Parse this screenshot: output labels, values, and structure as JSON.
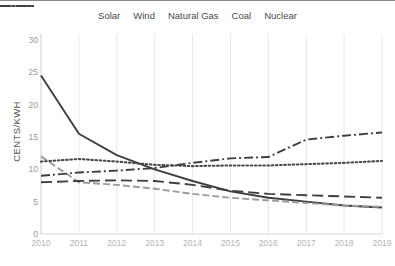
{
  "chart": {
    "type": "line",
    "title": "",
    "xlabel": "",
    "ylabel": "CENTS/KWH"
  },
  "legend": {
    "position": "top",
    "entries": [
      {
        "label": "Solar",
        "style": "solid",
        "color": "#3f3f3f",
        "icon": "line-solid-icon"
      },
      {
        "label": "Wind",
        "style": "dashed",
        "color": "#9b9b9b",
        "icon": "line-dashed-icon"
      },
      {
        "label": "Natural Gas",
        "style": "longdash",
        "color": "#3f3f3f",
        "icon": "line-longdash-icon"
      },
      {
        "label": "Coal",
        "style": "dotted",
        "color": "#4a4a4a",
        "icon": "line-dotted-icon"
      },
      {
        "label": "Nuclear",
        "style": "dashdot",
        "color": "#3f3f3f",
        "icon": "line-dashdot-icon"
      }
    ]
  },
  "axes": {
    "y_ticks": [
      "0",
      "5",
      "10",
      "15",
      "20",
      "25",
      "30"
    ],
    "y_min": 0,
    "y_max": 30,
    "y_step": 5,
    "x_ticks": [
      "2010",
      "2011",
      "2012",
      "2013",
      "2014",
      "2015",
      "2016",
      "2017",
      "2018",
      "2019"
    ],
    "grid": "vertical"
  },
  "chart_data": {
    "type": "line",
    "title": "",
    "xlabel": "",
    "ylabel": "CENTS/KWH",
    "ylim": [
      0,
      30
    ],
    "grid": "vertical-only",
    "legend_position": "top",
    "categories": [
      "2010",
      "2011",
      "2012",
      "2013",
      "2014",
      "2015",
      "2016",
      "2017",
      "2018",
      "2019"
    ],
    "series": [
      {
        "name": "Solar",
        "values": [
          24.5,
          15.5,
          12.2,
          10.0,
          8.2,
          6.6,
          5.6,
          5.0,
          4.4,
          4.1
        ]
      },
      {
        "name": "Wind",
        "values": [
          12.0,
          8.0,
          7.6,
          7.0,
          6.2,
          5.6,
          5.2,
          4.8,
          4.4,
          4.2
        ]
      },
      {
        "name": "Natural Gas",
        "values": [
          8.0,
          8.2,
          8.3,
          8.2,
          7.6,
          6.7,
          6.2,
          6.0,
          5.8,
          5.6
        ]
      },
      {
        "name": "Coal",
        "values": [
          11.2,
          11.6,
          11.2,
          10.7,
          10.5,
          10.6,
          10.6,
          10.8,
          11.0,
          11.3
        ]
      },
      {
        "name": "Nuclear",
        "values": [
          9.0,
          9.5,
          9.8,
          10.2,
          11.0,
          11.7,
          11.9,
          14.6,
          15.2,
          15.7
        ]
      }
    ]
  }
}
